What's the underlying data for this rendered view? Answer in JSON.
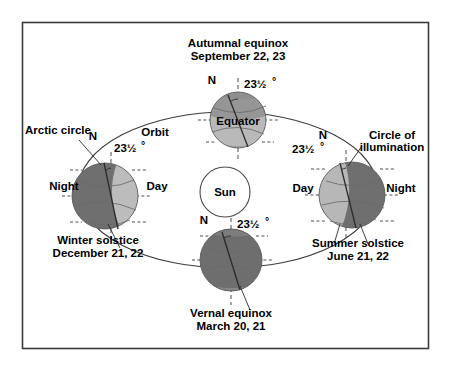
{
  "figure": {
    "title_absent": true,
    "background_color": "#ffffff",
    "frame_color": "#3a3a3a",
    "orbit_label": "Orbit",
    "sun_label": "Sun",
    "axis_tilt_label": "23½",
    "axis_tilt_degree_symbol": "°",
    "north_pole_label": "N"
  },
  "positions": [
    {
      "id": "autumnal-equinox",
      "season_label": "Autumnal equinox",
      "date_label": "September 22, 23",
      "extra_label": "Equator",
      "tilt_label": "23½",
      "pole_label": "N",
      "lit_side": "front",
      "shade": "half"
    },
    {
      "id": "winter-solstice",
      "season_label": "Winter solstice",
      "date_label": "December 21, 22",
      "extra_label": "Arctic circle",
      "night_label": "Night",
      "day_label": "Day",
      "tilt_label": "23½",
      "pole_label": "N",
      "lit_side": "right"
    },
    {
      "id": "summer-solstice",
      "season_label": "Summer solstice",
      "date_label": "June 21, 22",
      "extra_label": "Circle of illumination",
      "day_label": "Day",
      "night_label": "Night",
      "tilt_label": "23½",
      "pole_label": "N",
      "lit_side": "left"
    },
    {
      "id": "vernal-equinox",
      "season_label": "Vernal equinox",
      "date_label": "March 20, 21",
      "tilt_label": "23½",
      "pole_label": "N",
      "shade": "dark"
    }
  ],
  "colors": {
    "globe_dark": "#6e6e6e",
    "globe_light": "#b9b9b9",
    "globe_mid": "#9a9a9a",
    "sun_fill": "#ffffff",
    "line": "#3b3b3b",
    "text": "#000000"
  }
}
